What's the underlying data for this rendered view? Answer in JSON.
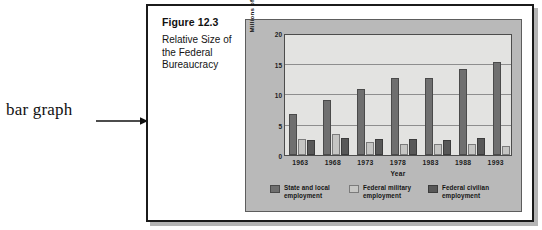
{
  "annotation": {
    "label": "bar graph",
    "arrow_icon": "arrow-right-icon"
  },
  "figure": {
    "caption_title": "Figure 12.3",
    "caption_subtitle": "Relative Size of the Federal Bureaucracy"
  },
  "chart_data": {
    "type": "bar",
    "title": "Relative Size of the Federal Bureaucracy",
    "xlabel": "Year",
    "ylabel": "Millions of Employees",
    "categories": [
      "1963",
      "1968",
      "1973",
      "1978",
      "1983",
      "1988",
      "1993"
    ],
    "ylim": [
      0,
      20
    ],
    "yticks": [
      "0",
      "5",
      "10",
      "15",
      "20"
    ],
    "grid": true,
    "legend_position": "bottom",
    "series": [
      {
        "name": "State and local employment",
        "color": "#6f6f6f",
        "values": [
          6.9,
          9.2,
          11.1,
          12.9,
          13.0,
          14.5,
          15.6
        ]
      },
      {
        "name": "Federal military employment",
        "color": "#c5c5c3",
        "values": [
          2.7,
          3.5,
          2.2,
          1.9,
          1.9,
          1.8,
          1.5
        ]
      },
      {
        "name": "Federal civilian employment",
        "color": "#585858",
        "values": [
          2.5,
          2.9,
          2.7,
          2.7,
          2.6,
          2.8,
          2.7
        ]
      }
    ]
  }
}
